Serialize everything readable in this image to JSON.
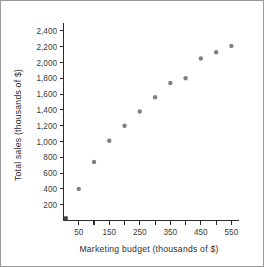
{
  "chart_data": {
    "type": "scatter",
    "title": "",
    "xlabel": "Marketing budget (thousands of $)",
    "ylabel": "Total sales (thousands of $)",
    "xlim": [
      0,
      575
    ],
    "ylim": [
      0,
      2500
    ],
    "grid": false,
    "legend": null,
    "x": [
      50,
      100,
      150,
      200,
      250,
      300,
      350,
      400,
      450,
      500,
      550
    ],
    "values": [
      400,
      740,
      1010,
      1200,
      1380,
      1560,
      1740,
      1800,
      2050,
      2130,
      2210
    ],
    "series": [
      {
        "name": "Total sales",
        "x": [
          50,
          100,
          150,
          200,
          250,
          300,
          350,
          400,
          450,
          500,
          550
        ],
        "values": [
          400,
          740,
          1010,
          1200,
          1380,
          1560,
          1740,
          1800,
          2050,
          2130,
          2210
        ],
        "color": "#808080",
        "marker": "circle"
      }
    ],
    "x_ticks": [
      {
        "value": 50,
        "label": "50"
      },
      {
        "value": 100,
        "label": ""
      },
      {
        "value": 150,
        "label": "150"
      },
      {
        "value": 200,
        "label": ""
      },
      {
        "value": 250,
        "label": "250"
      },
      {
        "value": 300,
        "label": ""
      },
      {
        "value": 350,
        "label": "350"
      },
      {
        "value": 400,
        "label": ""
      },
      {
        "value": 450,
        "label": "450"
      },
      {
        "value": 500,
        "label": ""
      },
      {
        "value": 550,
        "label": "550"
      }
    ],
    "y_ticks": [
      {
        "value": 200,
        "label": "200"
      },
      {
        "value": 400,
        "label": "400"
      },
      {
        "value": 600,
        "label": "600"
      },
      {
        "value": 800,
        "label": "800"
      },
      {
        "value": 1000,
        "label": "1,000"
      },
      {
        "value": 1200,
        "label": "1,200"
      },
      {
        "value": 1400,
        "label": "1,400"
      },
      {
        "value": 1600,
        "label": "1,600"
      },
      {
        "value": 1800,
        "label": "1,800"
      },
      {
        "value": 2000,
        "label": "2,000"
      },
      {
        "value": 2200,
        "label": "2,200"
      },
      {
        "value": 2400,
        "label": "2,400"
      }
    ]
  },
  "colors": {
    "point": "#808080",
    "axis": "#2b2b2b",
    "text": "#3c3c3c",
    "frame": "#9a9a9a",
    "background": "#ffffff"
  }
}
